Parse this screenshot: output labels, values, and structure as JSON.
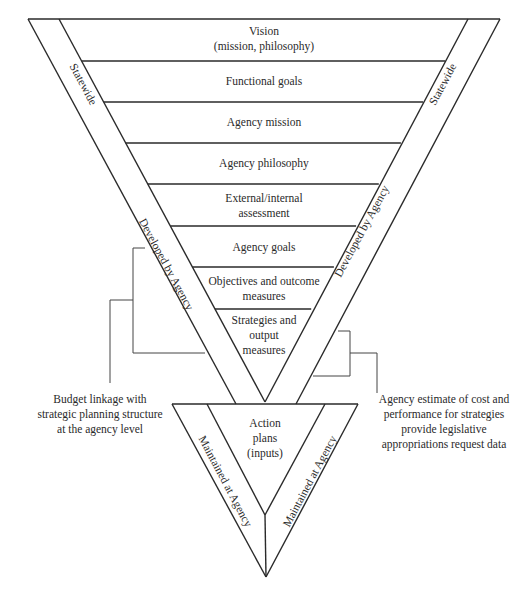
{
  "diagram": {
    "levels": [
      {
        "lines": [
          "Vision",
          "(mission, philosophy)"
        ]
      },
      {
        "lines": [
          "Functional goals"
        ]
      },
      {
        "lines": [
          "Agency mission"
        ]
      },
      {
        "lines": [
          "Agency philosophy"
        ]
      },
      {
        "lines": [
          "External/internal",
          "assessment"
        ]
      },
      {
        "lines": [
          "Agency goals"
        ]
      },
      {
        "lines": [
          "Objectives and outcome",
          "measures"
        ]
      },
      {
        "lines": [
          "Strategies and",
          "output",
          "measures"
        ]
      }
    ],
    "action_plans": {
      "lines": [
        "Action",
        "plans",
        "(inputs)"
      ]
    },
    "side_labels": {
      "statewide_left": "Statewide",
      "statewide_right": "Statewide",
      "developed_left": "Developed by Agency",
      "developed_right": "Developed by Agency",
      "maintained_left": "Maintained at Agency",
      "maintained_right": "Maintained at Agency"
    },
    "notes": {
      "left": [
        "Budget linkage with",
        "strategic planning structure",
        "at the agency level"
      ],
      "right": [
        "Agency estimate of cost and",
        "performance for strategies",
        "provide legislative",
        "appropriations request data"
      ]
    }
  }
}
